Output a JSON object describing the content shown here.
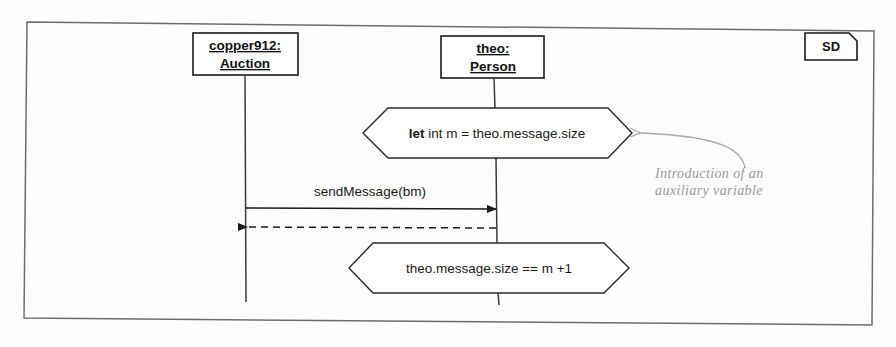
{
  "diagram": {
    "kind": "uml-sequence-diagram",
    "frame_tag": "SD",
    "lifelines": [
      {
        "id": "auction",
        "instance_name": "copper912:",
        "class_name": "Auction"
      },
      {
        "id": "person",
        "instance_name": "theo:",
        "class_name": "Person"
      }
    ],
    "constraints": [
      {
        "id": "let-constraint",
        "keyword": "let",
        "expression": "int m = theo.message.size",
        "full_text": "let int m = theo.message.size"
      },
      {
        "id": "assert-constraint",
        "keyword": "",
        "expression": "theo.message.size == m +1",
        "full_text": "theo.message.size == m +1"
      }
    ],
    "messages": [
      {
        "id": "send-message",
        "label": "sendMessage(bm)",
        "style": "solid",
        "direction": "right-to-left"
      },
      {
        "id": "return-message",
        "label": "",
        "style": "dashed",
        "direction": "left"
      }
    ],
    "annotation": {
      "line1": "Introduction of an",
      "line2": "auxiliary variable"
    },
    "colors": {
      "ink": "#1a1a1a",
      "frame": "#6d6d6d",
      "annotation": "#9a9a9a",
      "paper": "#fdfdfd"
    }
  }
}
